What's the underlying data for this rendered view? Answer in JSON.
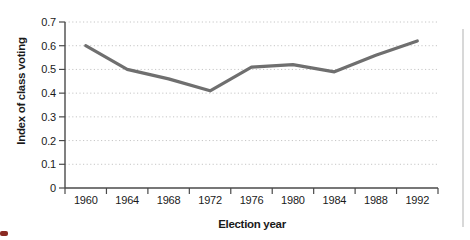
{
  "figure": {
    "background": "#ffffff",
    "page_edge_line_color": "#d8d8d8",
    "corner_mark_color": "#8a2a22"
  },
  "chart_data": {
    "type": "line",
    "title": "",
    "categories": [
      "1960",
      "1964",
      "1968",
      "1972",
      "1976",
      "1980",
      "1984",
      "1988",
      "1992"
    ],
    "values": [
      0.6,
      0.5,
      0.46,
      0.41,
      0.51,
      0.52,
      0.49,
      0.56,
      0.62
    ],
    "xlabel": "Election year",
    "ylabel": "Index of class voting",
    "ylim": [
      0,
      0.7
    ],
    "ytick_values": [
      0.7,
      0.6,
      0.5,
      0.4,
      0.3,
      0.2,
      0.1,
      0
    ],
    "ytick_labels": [
      "0.7",
      "0.6",
      "0.5",
      "0.4",
      "0.3",
      "0.2",
      "0.1",
      "0"
    ],
    "grid": "horizontal-dotted",
    "legend": "none",
    "line_color": "#6f6f6f",
    "axis_color": "#4a4a4a",
    "gridline_color": "#c6c6c6",
    "tick_label_color": "#1a1a1a"
  }
}
